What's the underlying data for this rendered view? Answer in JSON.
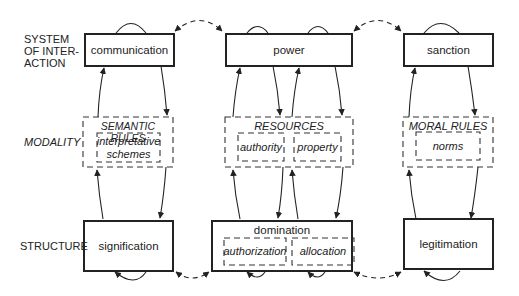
{
  "rows": {
    "system_of_interaction": "SYSTEM OF INTER- ACTION",
    "system_lines": [
      "SYSTEM",
      "OF INTER-",
      "ACTION"
    ],
    "modality": "MODALITY",
    "structure": "STRUCTURE"
  },
  "columns": [
    {
      "interaction": "communication",
      "modality": {
        "title": "SEMANTIC RULES",
        "items": [
          "interpretative schemes"
        ],
        "item_lines": [
          "interpretative",
          "schemes"
        ]
      },
      "structure": {
        "title": "signification",
        "items": []
      }
    },
    {
      "interaction": "power",
      "modality": {
        "title": "RESOURCES",
        "items": [
          "authority",
          "property"
        ]
      },
      "structure": {
        "title": "domination",
        "items": [
          "authorization",
          "allocation"
        ]
      }
    },
    {
      "interaction": "sanction",
      "modality": {
        "title": "MORAL RULES",
        "items": [
          "norms"
        ]
      },
      "structure": {
        "title": "legitimation",
        "items": []
      }
    }
  ],
  "colors": {
    "ink": "#222222",
    "background": "#ffffff"
  }
}
